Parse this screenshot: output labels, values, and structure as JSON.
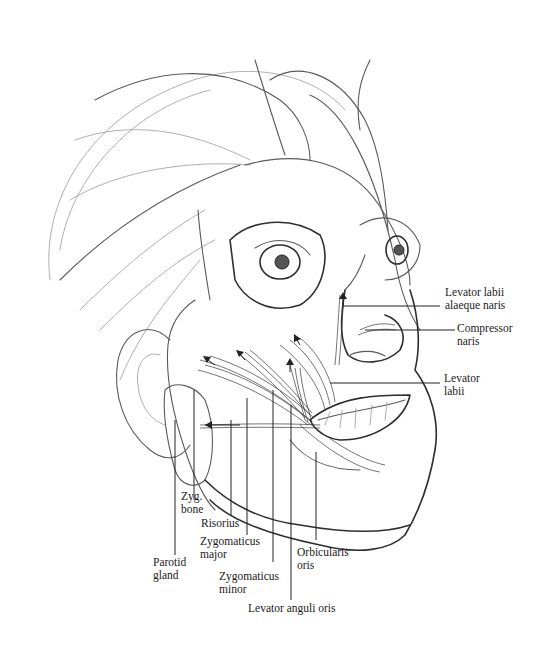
{
  "figure": {
    "labels": [
      {
        "id": "levator-labii-alaeque-naris",
        "lines": [
          "Levator labii",
          "alaeque naris"
        ]
      },
      {
        "id": "compressor-naris",
        "lines": [
          "Compressor",
          "naris"
        ]
      },
      {
        "id": "levator-labii",
        "lines": [
          "Levator",
          "labii"
        ]
      },
      {
        "id": "zyg-bone",
        "lines": [
          "Zyg.",
          "bone"
        ]
      },
      {
        "id": "risorius",
        "lines": [
          "Risorius"
        ]
      },
      {
        "id": "zygomaticus-major",
        "lines": [
          "Zygomaticus",
          "major"
        ]
      },
      {
        "id": "parotid-gland",
        "lines": [
          "Parotid",
          "gland"
        ]
      },
      {
        "id": "orbicularis-oris",
        "lines": [
          "Orbicularis",
          "oris"
        ]
      },
      {
        "id": "zygomaticus-minor",
        "lines": [
          "Zygomaticus",
          "minor"
        ]
      },
      {
        "id": "levator-anguli-oris",
        "lines": [
          "Levator anguli oris"
        ]
      }
    ]
  }
}
